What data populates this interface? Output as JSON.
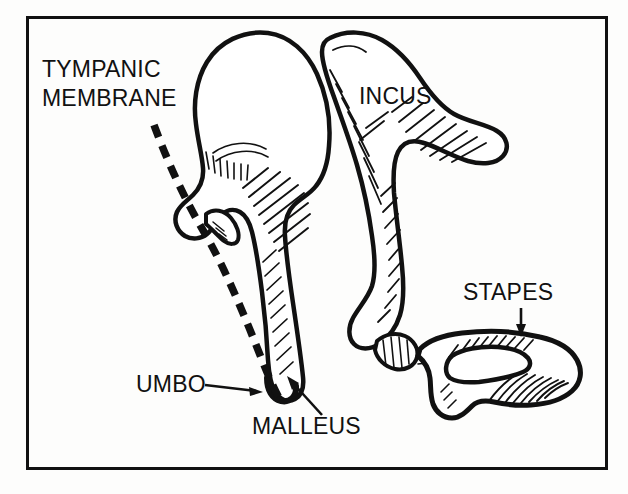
{
  "figure": {
    "name": "middle-ear-ossicles-diagram",
    "type": "anatomical-line-drawing",
    "background_color": "#fdfdfc",
    "ink_color": "#111111",
    "frame": {
      "name": "diagram-border",
      "x": 26,
      "y": 16,
      "width": 582,
      "height": 454,
      "stroke_width": 3
    }
  },
  "labels": {
    "tympanic_membrane_line1": "TYMPANIC",
    "tympanic_membrane_line2": "MEMBRANE",
    "incus": "INCUS",
    "stapes": "STAPES",
    "umbo": "UMBO",
    "malleus": "MALLEUS"
  },
  "leaders": {
    "tympanic_membrane": {
      "style": "dashed-curve",
      "description": "thick dashed curve tracing the tympanic membrane from upper left down to the umbo"
    },
    "incus": {
      "style": "none",
      "description": "label placed directly over the incus body"
    },
    "stapes": {
      "style": "vertical-arrow-down",
      "description": "short vertical arrow pointing down to the posterior crus of the stapes"
    },
    "umbo": {
      "style": "horizontal-arrow-right",
      "description": "horizontal arrow pointing right to the umbo at the tip of the manubrium"
    },
    "malleus": {
      "style": "diagonal-arrow-up-left",
      "description": "diagonal arrow pointing up and left to the manubrium of the malleus"
    }
  },
  "structures": [
    {
      "name": "malleus-head",
      "label_ref": "malleus"
    },
    {
      "name": "malleus-neck",
      "label_ref": "malleus"
    },
    {
      "name": "malleus-lateral-process",
      "label_ref": "malleus"
    },
    {
      "name": "malleus-manubrium",
      "label_ref": "malleus"
    },
    {
      "name": "umbo-tip",
      "label_ref": "umbo"
    },
    {
      "name": "incus-body",
      "label_ref": "incus"
    },
    {
      "name": "incus-short-process",
      "label_ref": "incus"
    },
    {
      "name": "incus-long-process",
      "label_ref": "incus"
    },
    {
      "name": "incus-lenticular-process",
      "label_ref": "incus"
    },
    {
      "name": "stapes-head",
      "label_ref": "stapes"
    },
    {
      "name": "stapes-anterior-crus",
      "label_ref": "stapes"
    },
    {
      "name": "stapes-posterior-crus",
      "label_ref": "stapes"
    },
    {
      "name": "stapes-obturator-foramen",
      "label_ref": "stapes"
    },
    {
      "name": "stapes-footplate",
      "label_ref": "stapes"
    },
    {
      "name": "tympanic-membrane",
      "label_ref": "tympanic_membrane_line1"
    }
  ]
}
